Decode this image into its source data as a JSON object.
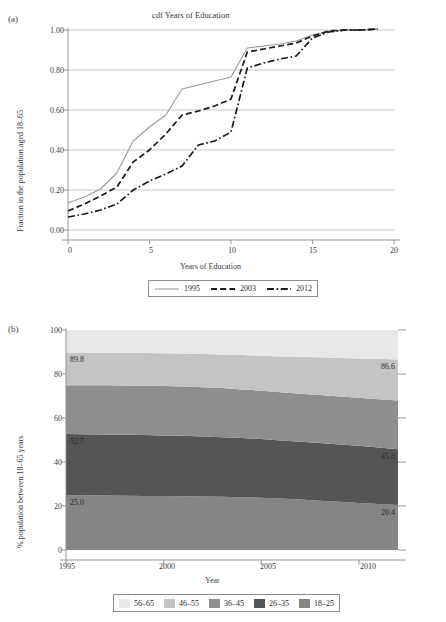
{
  "figure": {
    "panels": [
      {
        "id": "a",
        "label": "(a)",
        "title": "cdf Years of Education",
        "xlabel": "Years of Education",
        "ylabel": "Fraction in the population aged 18–65"
      },
      {
        "id": "b",
        "label": "(b)",
        "title": "",
        "xlabel": "Year",
        "ylabel": "% population between 18–65 years"
      }
    ]
  },
  "chart_data": [
    {
      "type": "line",
      "panel": "a",
      "title": "cdf Years of Education",
      "xlabel": "Years of Education",
      "ylabel": "Fraction in the population aged 18–65",
      "xlim": [
        0,
        20
      ],
      "ylim": [
        0.0,
        1.0
      ],
      "xticks": [
        "0",
        "5",
        "10",
        "15",
        "20"
      ],
      "xtick_values": [
        0,
        5,
        10,
        15,
        20
      ],
      "yticks": [
        "0.00",
        "0.20",
        "0.40",
        "0.60",
        "0.80",
        "1.00"
      ],
      "ytick_values": [
        0.0,
        0.2,
        0.4,
        0.6,
        0.8,
        1.0
      ],
      "grid": "horizontal",
      "legend_position": "below",
      "x": [
        0,
        1,
        2,
        3,
        4,
        5,
        6,
        7,
        8,
        9,
        10,
        11,
        12,
        13,
        14,
        15,
        16,
        17,
        18,
        19
      ],
      "series": [
        {
          "name": "1995",
          "style": "solid",
          "color": "#9a9a9a",
          "values": [
            0.135,
            0.165,
            0.205,
            0.285,
            0.445,
            0.515,
            0.575,
            0.705,
            0.725,
            0.745,
            0.765,
            0.91,
            0.92,
            0.93,
            0.945,
            0.975,
            0.995,
            1.0,
            1.0,
            1.005
          ]
        },
        {
          "name": "2003",
          "style": "dashed",
          "color": "#1a1a1a",
          "values": [
            0.095,
            0.13,
            0.17,
            0.215,
            0.34,
            0.4,
            0.48,
            0.575,
            0.595,
            0.62,
            0.655,
            0.89,
            0.905,
            0.92,
            0.935,
            0.97,
            0.995,
            1.0,
            1.0,
            1.005
          ]
        },
        {
          "name": "2012",
          "style": "dash-dot",
          "color": "#1a1a1a",
          "values": [
            0.065,
            0.08,
            0.1,
            0.13,
            0.2,
            0.245,
            0.28,
            0.32,
            0.425,
            0.445,
            0.49,
            0.81,
            0.835,
            0.855,
            0.87,
            0.96,
            0.99,
            1.0,
            1.0,
            1.005
          ]
        }
      ],
      "legend": [
        "1995",
        "2003",
        "2012"
      ]
    },
    {
      "type": "area",
      "panel": "b",
      "title": "",
      "xlabel": "Year",
      "ylabel": "% population between 18–65 years",
      "xlim": [
        1995,
        2012
      ],
      "ylim": [
        0,
        100
      ],
      "xticks": [
        "1995",
        "2000",
        "2005",
        "2010"
      ],
      "xtick_values": [
        1995,
        2000,
        2005,
        2010
      ],
      "yticks": [
        "0",
        "20",
        "40",
        "60",
        "80",
        "100"
      ],
      "ytick_values": [
        0,
        20,
        40,
        60,
        80,
        100
      ],
      "stacked": true,
      "grid": "none",
      "legend_position": "below",
      "x": [
        1995,
        1996,
        1997,
        1998,
        1999,
        2000,
        2001,
        2002,
        2003,
        2004,
        2005,
        2006,
        2007,
        2008,
        2009,
        2010,
        2011,
        2012
      ],
      "series": [
        {
          "name": "18–25",
          "color": "#858585",
          "cumulative_top": [
            25.0,
            24.9,
            24.8,
            24.7,
            24.6,
            24.5,
            24.4,
            24.3,
            24.2,
            24.0,
            23.8,
            23.4,
            22.9,
            22.4,
            21.9,
            21.4,
            20.9,
            20.4
          ]
        },
        {
          "name": "26–35",
          "color": "#555555",
          "cumulative_top": [
            52.7,
            52.6,
            52.5,
            52.4,
            52.3,
            52.1,
            51.9,
            51.6,
            51.3,
            50.9,
            50.4,
            49.8,
            49.2,
            48.6,
            48.0,
            47.4,
            46.6,
            45.8
          ]
        },
        {
          "name": "36–45",
          "color": "#8e8e8e",
          "cumulative_top": [
            74.9,
            74.9,
            74.9,
            74.8,
            74.7,
            74.6,
            74.3,
            74.0,
            73.6,
            73.0,
            72.4,
            71.7,
            71.0,
            70.4,
            69.8,
            69.2,
            68.5,
            67.9
          ]
        },
        {
          "name": "46–55",
          "color": "#c4c4c4",
          "cumulative_top": [
            89.8,
            89.8,
            89.7,
            89.6,
            89.5,
            89.4,
            89.3,
            89.1,
            88.9,
            88.6,
            88.3,
            88.0,
            87.8,
            87.6,
            87.3,
            87.1,
            86.9,
            86.6
          ]
        },
        {
          "name": "56–65",
          "color": "#e8e8e8",
          "cumulative_top": [
            100,
            100,
            100,
            100,
            100,
            100,
            100,
            100,
            100,
            100,
            100,
            100,
            100,
            100,
            100,
            100,
            100,
            100
          ]
        }
      ],
      "legend": [
        "56–65",
        "46–55",
        "36–45",
        "26–35",
        "18–25"
      ],
      "annotations": [
        {
          "text": "89.8",
          "x": 1995,
          "y": 89.8,
          "side": "left"
        },
        {
          "text": "52.7",
          "x": 1995,
          "y": 52.7,
          "side": "left"
        },
        {
          "text": "25.0",
          "x": 1995,
          "y": 25.0,
          "side": "left"
        },
        {
          "text": "86.6",
          "x": 2012,
          "y": 86.6,
          "side": "right"
        },
        {
          "text": "45.8",
          "x": 2012,
          "y": 45.8,
          "side": "right"
        },
        {
          "text": "20.4",
          "x": 2012,
          "y": 20.4,
          "side": "right"
        }
      ]
    }
  ],
  "colors": {
    "series_1995": "#9a9a9a",
    "series_2003": "#1a1a1a",
    "series_2012": "#1a1a1a",
    "band_56_65": "#e8e8e8",
    "band_46_55": "#c4c4c4",
    "band_36_45": "#8e8e8e",
    "band_26_35": "#555555",
    "band_18_25": "#858585",
    "axis": "#8d8d8d",
    "grid": "#b9b9b9"
  }
}
